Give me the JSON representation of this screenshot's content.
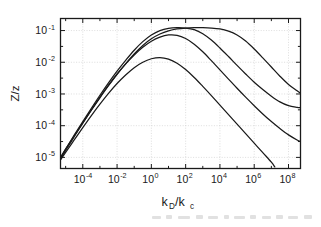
{
  "figure": {
    "kind": "scientific-plot",
    "background": "#ffffff",
    "line_color": "#1a1a1a",
    "grid_color": "#cfcfcf",
    "axis_color": "#1a1a1a"
  },
  "axes": {
    "y_label": "Z/z",
    "x_label_main": "k",
    "x_label_sub1": "D",
    "x_label_slash": "/k",
    "x_label_sub2": "c",
    "x_label_plain": "kD/kc",
    "x_ticks": [
      {
        "mantissa": "10",
        "exponent": "-4",
        "value": -4
      },
      {
        "mantissa": "10",
        "exponent": "-2",
        "value": -2
      },
      {
        "mantissa": "10",
        "exponent": "0",
        "value": 0
      },
      {
        "mantissa": "10",
        "exponent": "2",
        "value": 2
      },
      {
        "mantissa": "10",
        "exponent": "4",
        "value": 4
      },
      {
        "mantissa": "10",
        "exponent": "6",
        "value": 6
      },
      {
        "mantissa": "10",
        "exponent": "8",
        "value": 8
      }
    ],
    "y_ticks": [
      {
        "mantissa": "10",
        "exponent": "-1",
        "value": -1
      },
      {
        "mantissa": "10",
        "exponent": "-2",
        "value": -2
      },
      {
        "mantissa": "10",
        "exponent": "-3",
        "value": -3
      },
      {
        "mantissa": "10",
        "exponent": "-4",
        "value": -4
      },
      {
        "mantissa": "10",
        "exponent": "-5",
        "value": -5
      }
    ]
  },
  "chart_data": {
    "type": "line",
    "title": "",
    "subtitle": "",
    "xlabel": "kD/kc",
    "ylabel": "Z/z",
    "xscale": "log",
    "yscale": "log",
    "xlim": [
      -5.3,
      8.7
    ],
    "ylim": [
      -5.35,
      -0.62
    ],
    "grid": true,
    "grid_style": "dotted",
    "legend": "none",
    "minor_ticks": true,
    "annotations": [],
    "series": [
      {
        "name": "curve-1-broadest",
        "comment": "widest plateau, peak near kD/kc = 1e2",
        "x": [
          -5.3,
          -5.0,
          -4.5,
          -4.0,
          -3.5,
          -3.0,
          -2.5,
          -2.0,
          -1.5,
          -1.0,
          -0.5,
          0.0,
          0.5,
          1.0,
          1.5,
          2.0,
          2.5,
          3.0,
          3.5,
          4.0,
          4.5,
          5.0,
          5.5,
          6.0,
          6.5,
          7.0,
          7.5,
          8.0,
          8.5,
          8.7
        ],
        "y": [
          -5.0,
          -4.74,
          -4.32,
          -3.91,
          -3.51,
          -3.12,
          -2.74,
          -2.38,
          -2.05,
          -1.74,
          -1.47,
          -1.26,
          -1.11,
          -1.01,
          -0.95,
          -0.92,
          -0.91,
          -0.91,
          -0.92,
          -0.95,
          -1.02,
          -1.14,
          -1.33,
          -1.58,
          -1.86,
          -2.15,
          -2.44,
          -2.7,
          -2.9,
          -2.98
        ]
      },
      {
        "name": "curve-2",
        "comment": "peak near kD/kc = 1e0.7, same height as curve 1",
        "x": [
          -5.3,
          -5.0,
          -4.5,
          -4.0,
          -3.5,
          -3.0,
          -2.5,
          -2.0,
          -1.5,
          -1.0,
          -0.5,
          0.0,
          0.5,
          1.0,
          1.5,
          2.0,
          2.5,
          3.0,
          3.5,
          4.0,
          4.5,
          5.0,
          5.5,
          6.0,
          6.5,
          7.0,
          7.5,
          8.0,
          8.5,
          8.7
        ],
        "y": [
          -5.02,
          -4.74,
          -4.3,
          -3.87,
          -3.45,
          -3.04,
          -2.65,
          -2.28,
          -1.94,
          -1.62,
          -1.35,
          -1.14,
          -1.0,
          -0.93,
          -0.91,
          -0.92,
          -0.97,
          -1.1,
          -1.3,
          -1.55,
          -1.82,
          -2.1,
          -2.37,
          -2.63,
          -2.86,
          -3.07,
          -3.25,
          -3.37,
          -3.42,
          -3.43
        ]
      },
      {
        "name": "curve-3",
        "comment": "peak about 8e-2 near kD/kc = 1e0.3",
        "x": [
          -5.3,
          -5.0,
          -4.5,
          -4.0,
          -3.5,
          -3.0,
          -2.5,
          -2.0,
          -1.5,
          -1.0,
          -0.5,
          0.0,
          0.5,
          1.0,
          1.5,
          2.0,
          2.5,
          3.0,
          3.5,
          4.0,
          4.5,
          5.0,
          5.5,
          6.0,
          6.5,
          7.0,
          7.5,
          8.0,
          8.5,
          8.7
        ],
        "y": [
          -5.05,
          -4.78,
          -4.35,
          -3.92,
          -3.5,
          -3.1,
          -2.72,
          -2.37,
          -2.05,
          -1.77,
          -1.53,
          -1.34,
          -1.21,
          -1.14,
          -1.15,
          -1.25,
          -1.43,
          -1.67,
          -1.95,
          -2.24,
          -2.53,
          -2.82,
          -3.1,
          -3.37,
          -3.63,
          -3.87,
          -4.09,
          -4.29,
          -4.45,
          -4.5
        ]
      },
      {
        "name": "curve-4-lowest",
        "comment": "peak about 1.5e-2 at kD/kc = 1e0, falls off scale near 1e7",
        "x": [
          -5.3,
          -5.0,
          -4.5,
          -4.0,
          -3.5,
          -3.0,
          -2.5,
          -2.0,
          -1.5,
          -1.0,
          -0.5,
          0.0,
          0.5,
          1.0,
          1.5,
          2.0,
          2.5,
          3.0,
          3.5,
          4.0,
          4.5,
          5.0,
          5.5,
          6.0,
          6.5,
          7.0,
          7.2
        ],
        "y": [
          -5.08,
          -4.84,
          -4.45,
          -4.06,
          -3.68,
          -3.32,
          -2.98,
          -2.67,
          -2.4,
          -2.17,
          -2.0,
          -1.89,
          -1.85,
          -1.9,
          -2.03,
          -2.23,
          -2.48,
          -2.76,
          -3.05,
          -3.35,
          -3.65,
          -3.95,
          -4.25,
          -4.55,
          -4.85,
          -5.15,
          -5.3
        ]
      }
    ]
  }
}
